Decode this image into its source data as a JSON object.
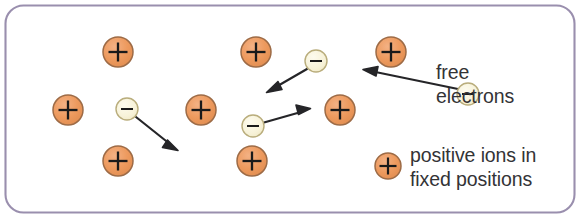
{
  "figure": {
    "border_color": "#9a8fae",
    "background_color": "#ffffff"
  },
  "colors": {
    "ion_fill": "#ed9a5e",
    "ion_stroke": "#9d6b46",
    "ion_symbol": "#1a1a1a",
    "electron_fill": "#f7f2d8",
    "electron_stroke": "#b9ad7c",
    "electron_symbol": "#1a1a1a",
    "arrow": "#252528",
    "text": "#333336",
    "border": "#9a8fae"
  },
  "legend": {
    "free_electrons": {
      "line1": "free",
      "line2": "electrons"
    },
    "positive_ions": {
      "line1": "positive ions in",
      "line2": "fixed positions"
    }
  },
  "diagram_data": {
    "type": "diagram",
    "ions": [
      {
        "id": "ion-1",
        "cx": 118,
        "cy": 52,
        "r": 15
      },
      {
        "id": "ion-2",
        "cx": 256,
        "cy": 52,
        "r": 15
      },
      {
        "id": "ion-3",
        "cx": 391,
        "cy": 52,
        "r": 15
      },
      {
        "id": "ion-4",
        "cx": 68,
        "cy": 110,
        "r": 15
      },
      {
        "id": "ion-5",
        "cx": 201,
        "cy": 110,
        "r": 15
      },
      {
        "id": "ion-6",
        "cx": 340,
        "cy": 110,
        "r": 15
      },
      {
        "id": "ion-7",
        "cx": 118,
        "cy": 161,
        "r": 15
      },
      {
        "id": "ion-8",
        "cx": 252,
        "cy": 161,
        "r": 15
      }
    ],
    "legend_ion": {
      "id": "legend-ion",
      "cx": 388,
      "cy": 166,
      "r": 13
    },
    "electrons": [
      {
        "id": "electron-1",
        "cx": 127,
        "cy": 109,
        "r": 11
      },
      {
        "id": "electron-2",
        "cx": 316,
        "cy": 61,
        "r": 11
      },
      {
        "id": "electron-3",
        "cx": 253,
        "cy": 126,
        "r": 11
      },
      {
        "id": "electron-4",
        "cx": 468,
        "cy": 94,
        "r": 11
      }
    ],
    "arrows": [
      {
        "id": "arrow-1",
        "from": "electron-1",
        "x1": 136,
        "y1": 117,
        "x2": 176,
        "y2": 149,
        "direction": "down-right"
      },
      {
        "id": "arrow-2",
        "from": "electron-2",
        "x1": 307,
        "y1": 69,
        "x2": 268,
        "y2": 92,
        "direction": "down-left"
      },
      {
        "id": "arrow-3",
        "from": "electron-3",
        "x1": 264,
        "y1": 122,
        "x2": 310,
        "y2": 109,
        "direction": "up-right"
      },
      {
        "id": "arrow-4",
        "from": "electron-4",
        "x1": 458,
        "y1": 89,
        "x2": 364,
        "y2": 68,
        "direction": "up-left"
      }
    ],
    "border_rect": {
      "x": 5,
      "y": 5,
      "width": 570,
      "height": 208,
      "rx": 18
    },
    "ion_symbol": "+",
    "electron_symbol": "−"
  }
}
